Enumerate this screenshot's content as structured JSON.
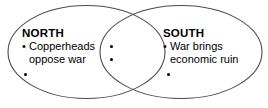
{
  "diagram": {
    "type": "venn",
    "title": "",
    "background_color": "#ffffff",
    "stroke_color": "#4a4a4a",
    "text_color": "#000000",
    "left_circle": {
      "heading": "NORTH",
      "items": [
        {
          "lines": [
            "Copperheads",
            "oppose war"
          ],
          "has_text": true
        },
        {
          "lines": [],
          "has_text": false
        }
      ]
    },
    "right_circle": {
      "heading": "SOUTH",
      "items": [
        {
          "lines": [
            "War brings",
            "economic ruin"
          ],
          "has_text": true
        },
        {
          "lines": [],
          "has_text": false
        }
      ]
    },
    "overlap": {
      "heading": "",
      "items": [
        {
          "lines": [],
          "has_text": false
        },
        {
          "lines": [],
          "has_text": false
        }
      ]
    },
    "bullet_glyph": "•"
  }
}
